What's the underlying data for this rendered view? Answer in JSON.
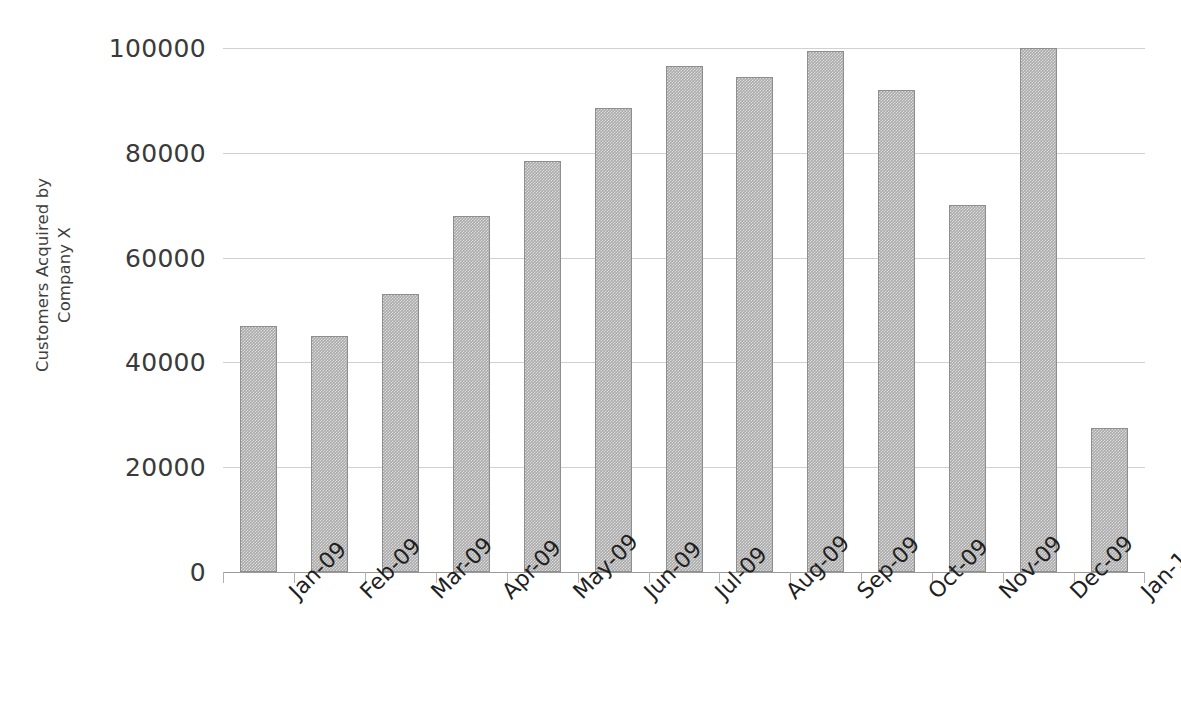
{
  "chart_data": {
    "type": "bar",
    "title": "",
    "subtitle": "",
    "xlabel": "",
    "ylabel": "Customers Acquired by Company X",
    "ylabel_lines": [
      "Customers Acquired by",
      "Company X"
    ],
    "categories": [
      "Jan-09",
      "Feb-09",
      "Mar-09",
      "Apr-09",
      "May-09",
      "Jun-09",
      "Jul-09",
      "Aug-09",
      "Sep-09",
      "Oct-09",
      "Nov-09",
      "Dec-09",
      "Jan-10"
    ],
    "values": [
      47000,
      45000,
      53000,
      68000,
      78500,
      88500,
      96500,
      94500,
      99500,
      92000,
      70000,
      100000,
      27500
    ],
    "ylim": [
      0,
      100000
    ],
    "ytick_labels": [
      "0",
      "20000",
      "40000",
      "60000",
      "80000",
      "100000"
    ],
    "ytick_values": [
      0,
      20000,
      40000,
      60000,
      80000,
      100000
    ],
    "grid": true,
    "grid_axis": "y",
    "legend": false,
    "legend_position": "none",
    "series": [
      {
        "name": "Customers Acquired by Company X",
        "values": [
          47000,
          45000,
          53000,
          68000,
          78500,
          88500,
          96500,
          94500,
          99500,
          92000,
          70000,
          100000,
          27500
        ]
      }
    ],
    "colors": {
      "bar_fill": "#a9a9a9",
      "bar_border": "#8e8e8e",
      "gridline": "#c9c9c9",
      "axis": "#9a9a9a",
      "tick_label": "#3a3a3a",
      "axis_title": "#3f3f3f",
      "background": "#ffffff"
    }
  }
}
